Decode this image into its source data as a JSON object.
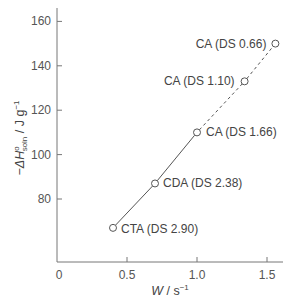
{
  "chart_data": {
    "type": "line",
    "title": "",
    "xlabel": "W / s⁻¹",
    "ylabel": "−ΔH°soln / J g⁻¹",
    "xlim": [
      0,
      1.65
    ],
    "ylim": [
      52,
      166
    ],
    "x_ticks": [
      0,
      0.5,
      1.0,
      1.5
    ],
    "x_tick_labels": [
      "0",
      "0.5",
      "1.0",
      "1.5"
    ],
    "y_ticks": [
      80,
      100,
      120,
      140,
      160
    ],
    "y_tick_labels": [
      "80",
      "100",
      "120",
      "140",
      "160"
    ],
    "grid": false,
    "legend": null,
    "series": [
      {
        "name": "cellulose acetates",
        "points": [
          {
            "x": 0.4,
            "y": 67,
            "label": "CTA (DS 2.90)"
          },
          {
            "x": 0.7,
            "y": 87,
            "label": "CDA (DS 2.38)"
          },
          {
            "x": 1.0,
            "y": 110,
            "label": "CA (DS 1.66)"
          },
          {
            "x": 1.34,
            "y": 133,
            "label": "CA (DS 1.10)"
          },
          {
            "x": 1.56,
            "y": 150,
            "label": "CA (DS 0.66)"
          }
        ],
        "solid_segment": [
          0,
          2
        ],
        "dashed_segment": [
          2,
          4
        ],
        "marker": "open-circle"
      }
    ]
  },
  "axes": {
    "x_title_main": "W",
    "x_title_unit": " / s",
    "x_title_sup": "−1",
    "y_title_prefix": "−ΔH",
    "y_title_sup": "o",
    "y_title_sub": "soln",
    "y_title_unit": " / J g",
    "y_title_unit_sup": "−1"
  }
}
